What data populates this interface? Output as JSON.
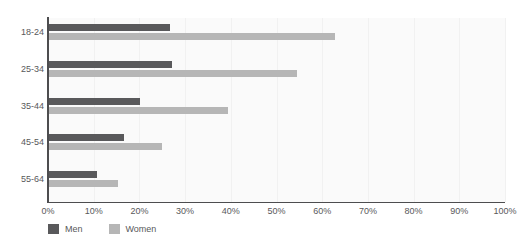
{
  "chart_data": {
    "type": "bar",
    "orientation": "horizontal",
    "title": "",
    "subtitle": "",
    "xlabel": "",
    "ylabel": "",
    "xlim": [
      0,
      100
    ],
    "grid": true,
    "legend_position": "bottom-left",
    "categories": [
      "18-24",
      "25-34",
      "35-44",
      "45-54",
      "55-64"
    ],
    "x_tick_labels": [
      "0%",
      "10%",
      "20%",
      "30%",
      "40%",
      "50%",
      "60%",
      "70%",
      "80%",
      "90%",
      "100%"
    ],
    "x_tick_values": [
      0,
      10,
      20,
      30,
      40,
      50,
      60,
      70,
      80,
      90,
      100
    ],
    "series": [
      {
        "name": "Men",
        "color": "#59595b",
        "values": [
          26.7,
          27.1,
          20.1,
          16.6,
          10.7
        ]
      },
      {
        "name": "Women",
        "color": "#b6b6b6",
        "values": [
          62.8,
          54.5,
          39.4,
          24.9,
          15.3
        ]
      }
    ]
  },
  "legend": {
    "items": [
      {
        "label": "Men",
        "color": "#59595b"
      },
      {
        "label": "Women",
        "color": "#b6b6b6"
      }
    ]
  },
  "colors": {
    "men": "#59595b",
    "women": "#b6b6b6",
    "axis": "#4d4d4f",
    "text": "#58585a",
    "plot_background": "#fafafa",
    "grid": "#f1f1f1"
  }
}
